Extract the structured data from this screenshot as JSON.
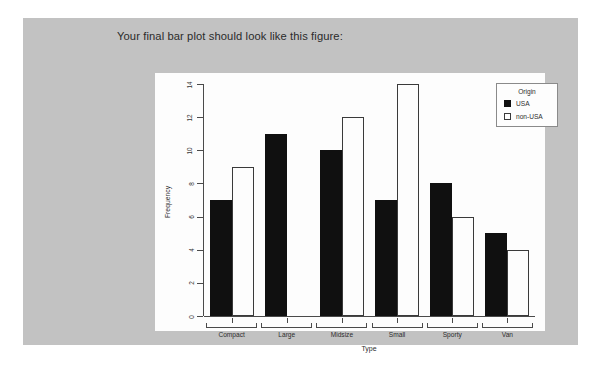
{
  "slide": {
    "caption": "Your final bar plot should look like this figure:",
    "background_color": "#c2c2c2",
    "page_background_color": "#ffffff"
  },
  "chart_data": {
    "type": "bar",
    "title": "",
    "xlabel": "Type",
    "ylabel": "Frequency",
    "categories": [
      "Compact",
      "Large",
      "Midsize",
      "Small",
      "Sporty",
      "Van"
    ],
    "series": [
      {
        "name": "USA",
        "color": "#101010",
        "values": [
          7,
          11,
          10,
          7,
          8,
          5
        ]
      },
      {
        "name": "non-USA",
        "color": "#ffffff",
        "values": [
          9,
          0,
          12,
          14,
          6,
          4
        ]
      }
    ],
    "ylim": [
      0,
      14
    ],
    "yticks": [
      0,
      2,
      4,
      6,
      8,
      10,
      12,
      14
    ],
    "grid": false,
    "legend": {
      "title": "Origin",
      "position": "top-right",
      "entries": [
        "USA",
        "non-USA"
      ]
    },
    "panel_background_color": "#fdfdfd",
    "axis_color": "#4a4a4a"
  }
}
